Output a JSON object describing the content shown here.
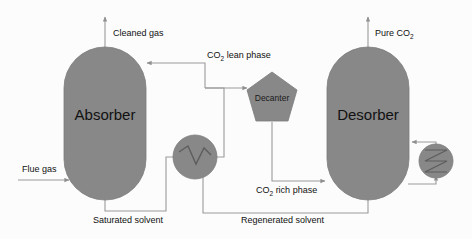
{
  "diagram": {
    "background_color": "#fcfcfc",
    "equipment_fill": "#888888",
    "equipment_stroke": "#6f6f6f",
    "line_color": "#9a9a9a",
    "text_color": "#111111"
  },
  "units": {
    "absorber": {
      "label": "Absorber",
      "shape": "rounded-column"
    },
    "desorber": {
      "label": "Desorber",
      "shape": "rounded-column"
    },
    "decanter": {
      "label": "Decanter",
      "shape": "pentagon"
    },
    "heat_exchanger": {
      "label": "",
      "icon": "heat-exchanger-zigzag-icon",
      "shape": "circle"
    },
    "reboiler": {
      "label": "",
      "icon": "reboiler-zigzag-icon",
      "shape": "circle"
    }
  },
  "streams": {
    "cleaned_gas": {
      "label": "Cleaned gas",
      "has_subscript": false
    },
    "pure_co2": {
      "label_pre": "Pure CO",
      "label_sub": "2",
      "label_post": "",
      "has_subscript": true
    },
    "flue_gas": {
      "label": "Flue gas",
      "has_subscript": false
    },
    "co2_lean_phase": {
      "label_pre": "CO",
      "label_sub": "2",
      "label_post": " lean phase",
      "has_subscript": true
    },
    "co2_rich_phase": {
      "label_pre": "CO",
      "label_sub": "2",
      "label_post": " rich phase",
      "has_subscript": true
    },
    "saturated_solvent": {
      "label": "Saturated solvent",
      "has_subscript": false
    },
    "regenerated_solvent": {
      "label": "Regenerated solvent",
      "has_subscript": false
    }
  }
}
